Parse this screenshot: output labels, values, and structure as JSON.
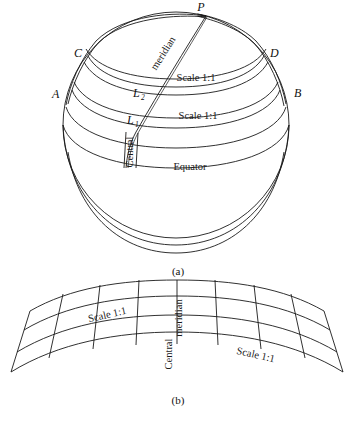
{
  "figure": {
    "title_hidden": "",
    "background_color": "#ffffff",
    "line_color": "#1a1a1a"
  },
  "panel_a": {
    "caption": "(a)",
    "kind": "globe-with-graticule",
    "points": [
      {
        "id": "P",
        "label": "P",
        "x": 206,
        "y": 13
      },
      {
        "id": "C",
        "label": "C",
        "x": 79,
        "y": 53
      },
      {
        "id": "D",
        "label": "D",
        "x": 271,
        "y": 53
      },
      {
        "id": "A",
        "label": "A",
        "x": 58,
        "y": 94
      },
      {
        "id": "B",
        "label": "B",
        "x": 294,
        "y": 93
      },
      {
        "id": "L2",
        "label": "L",
        "sub": "2",
        "x": 128,
        "y": 92
      },
      {
        "id": "L1",
        "label": "L",
        "sub": "1",
        "x": 122,
        "y": 119
      }
    ],
    "annotations": [
      {
        "id": "meridian-curved",
        "text": "meridian",
        "rotated": true
      },
      {
        "id": "scale-upper",
        "text": "Scale 1:1",
        "x": 196,
        "y": 78
      },
      {
        "id": "scale-lower",
        "text": "Scale  1:1",
        "x": 196,
        "y": 116
      },
      {
        "id": "central-vertical",
        "text": "Central",
        "rotated": true
      },
      {
        "id": "equator",
        "text": "Equator",
        "x": 190,
        "y": 167
      }
    ]
  },
  "panel_b": {
    "caption": "(b)",
    "kind": "projected-fan-graticule",
    "annotations": [
      {
        "id": "scale-left",
        "text": "Scale 1:1",
        "x": 106,
        "y": 318
      },
      {
        "id": "scale-right",
        "text": "Scale  1:1",
        "x": 255,
        "y": 357
      },
      {
        "id": "central-vertical",
        "text": "Central",
        "rotated": true
      },
      {
        "id": "meridian-vertical",
        "text": "meridian",
        "rotated": true
      }
    ],
    "grid": {
      "rows": 3,
      "columns": 6
    }
  }
}
